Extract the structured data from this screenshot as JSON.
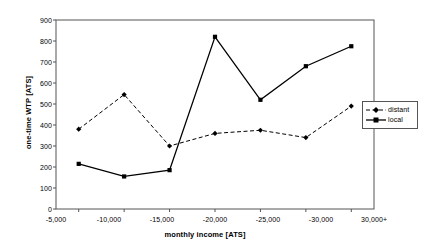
{
  "chart_data": {
    "type": "line",
    "title": "",
    "subtitle": "",
    "xlabel": "monthly income [ATS]",
    "ylabel": "one-time WTP [ATS]",
    "categories": [
      "-5,000",
      "-10,000",
      "-15,000",
      "-20,000",
      "-25,000",
      "-30,000",
      "30,000+"
    ],
    "ylim": [
      0,
      900
    ],
    "yticks": [
      0,
      100,
      200,
      300,
      400,
      500,
      600,
      700,
      800,
      900
    ],
    "ytick_labels": [
      "0",
      "100",
      "200",
      "300",
      "400",
      "500",
      "600",
      "700",
      "800",
      "900"
    ],
    "grid": false,
    "legend_position": "right",
    "series": [
      {
        "name": "distant",
        "values": [
          380,
          545,
          300,
          360,
          375,
          340,
          490
        ],
        "line_style": "dashed",
        "marker": "diamond",
        "color": "#000000"
      },
      {
        "name": "local",
        "values": [
          215,
          155,
          185,
          820,
          520,
          680,
          775
        ],
        "line_style": "solid",
        "marker": "square",
        "color": "#000000"
      }
    ]
  },
  "axes": {
    "y_title": "one-time WTP [ATS]",
    "x_title": "monthly income [ATS]",
    "y_ticks": [
      {
        "label": "900"
      },
      {
        "label": "800"
      },
      {
        "label": "700"
      },
      {
        "label": "600"
      },
      {
        "label": "500"
      },
      {
        "label": "400"
      },
      {
        "label": "300"
      },
      {
        "label": "200"
      },
      {
        "label": "100"
      },
      {
        "label": "0"
      }
    ],
    "x_ticks": [
      {
        "label": "-5,000"
      },
      {
        "label": "-10,000"
      },
      {
        "label": "-15,000"
      },
      {
        "label": "-20,000"
      },
      {
        "label": "-25,000"
      },
      {
        "label": "-30,000"
      },
      {
        "label": "30,000+"
      }
    ]
  },
  "legend": {
    "entries": [
      {
        "label": "distant"
      },
      {
        "label": "local"
      }
    ]
  }
}
